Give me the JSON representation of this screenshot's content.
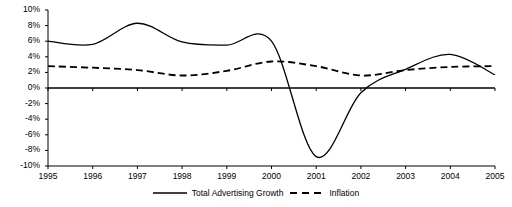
{
  "chart_data": {
    "type": "line",
    "title": "",
    "xlabel": "",
    "ylabel": "",
    "x": [
      1995,
      1996,
      1997,
      1998,
      1999,
      2000,
      2001,
      2002,
      2003,
      2004,
      2005
    ],
    "xlim": [
      1995,
      2005
    ],
    "ylim": [
      -10,
      10
    ],
    "ytick_labels": [
      "10%",
      "8%",
      "6%",
      "4%",
      "2%",
      "0%",
      "-2%",
      "-4%",
      "-6%",
      "-8%",
      "-10%"
    ],
    "ytick_values": [
      10,
      8,
      6,
      4,
      2,
      0,
      -2,
      -4,
      -6,
      -8,
      -10
    ],
    "xtick_labels": [
      "1995",
      "1996",
      "1997",
      "1998",
      "1999",
      "2000",
      "2001",
      "2002",
      "2003",
      "2004",
      "2005"
    ],
    "grid": false,
    "zero_line": true,
    "legend_position": "bottom",
    "series": [
      {
        "name": "Total Advertising Growth",
        "style": "solid",
        "color": "#000000",
        "values": [
          6.0,
          5.6,
          8.3,
          5.9,
          5.5,
          6.0,
          -8.8,
          -0.6,
          2.4,
          4.3,
          1.7
        ]
      },
      {
        "name": "Inflation",
        "style": "dashed",
        "color": "#000000",
        "values": [
          2.8,
          2.6,
          2.3,
          1.6,
          2.2,
          3.4,
          2.8,
          1.6,
          2.3,
          2.7,
          2.8
        ]
      }
    ]
  },
  "legend": {
    "entries": [
      {
        "label": "Total Advertising Growth",
        "style": "solid"
      },
      {
        "label": "Inflation",
        "style": "dashed"
      }
    ]
  }
}
